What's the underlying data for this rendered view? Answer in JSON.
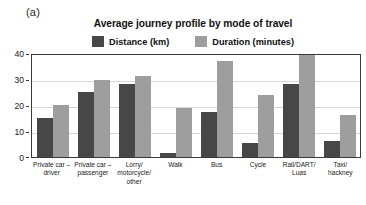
{
  "figure": {
    "panel_label": "(a)"
  },
  "chart_data": {
    "type": "bar",
    "title": "Average journey profile by mode of travel",
    "xlabel": "",
    "ylabel": "",
    "ylim": [
      0,
      40
    ],
    "yticks": [
      "0",
      "10",
      "20",
      "30",
      "40"
    ],
    "grid": true,
    "legend_position": "top-center",
    "categories": [
      "Private car – driver",
      "Private car – passenger",
      "Lorry/ motorcycle/ other",
      "Walk",
      "Bus",
      "Cycle",
      "Rail/DART/ Luas",
      "Taxi/ hackney"
    ],
    "series": [
      {
        "name": "Distance (km)",
        "color": "#474747",
        "values": [
          15,
          25,
          28,
          1.5,
          17.5,
          5.5,
          28,
          6
        ]
      },
      {
        "name": "Duration (minutes)",
        "color": "#9e9e9e",
        "values": [
          20,
          29.5,
          31,
          19,
          37,
          24,
          40,
          16
        ]
      }
    ]
  }
}
